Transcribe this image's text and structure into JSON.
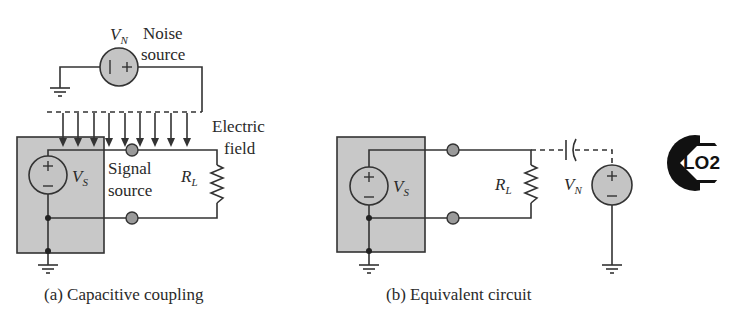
{
  "figure_a": {
    "noise_source_symbol": "V",
    "noise_source_subscript": "N",
    "noise_label_line1": "Noise",
    "noise_label_line2": "source",
    "field_label_line1": "Electric",
    "field_label_line2": "field",
    "signal_source_symbol": "V",
    "signal_source_subscript": "S",
    "signal_label_line1": "Signal",
    "signal_label_line2": "source",
    "load_symbol": "R",
    "load_subscript": "L",
    "caption": "(a) Capacitive coupling"
  },
  "figure_b": {
    "signal_source_symbol": "V",
    "signal_source_subscript": "S",
    "load_symbol": "R",
    "load_subscript": "L",
    "noise_source_symbol": "V",
    "noise_source_subscript": "N",
    "caption": "(b) Equivalent circuit"
  },
  "badge": {
    "text": "LO2"
  },
  "colors": {
    "wire": "#333333",
    "shield_fill": "#c8c8c8",
    "source_fill": "#c4c4c4",
    "terminal_fill": "#9a9a9a"
  }
}
